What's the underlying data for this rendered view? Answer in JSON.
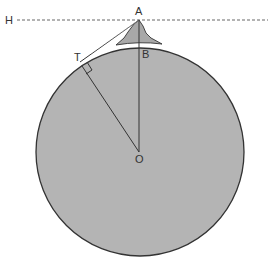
{
  "diagram": {
    "labels": {
      "H": "H",
      "A": "A",
      "B": "B",
      "T": "T",
      "O": "O"
    },
    "colors": {
      "earth_fill": "#b4b4b4",
      "mountain_fill": "#a8a8a8",
      "stroke": "#333333",
      "dashed_line": "#555555",
      "background": "#ffffff"
    },
    "points": {
      "A": [
        139,
        20
      ],
      "B": [
        139,
        48
      ],
      "T": [
        82,
        70
      ],
      "O": [
        139,
        152
      ],
      "H": [
        17,
        20
      ]
    },
    "circle": {
      "cx": 140,
      "cy": 152,
      "r": 104
    },
    "elements": [
      "Earth circle centered at O",
      "Mountain with peak A",
      "Dashed horizontal line H through A",
      "Tangent line from A to T",
      "Radius OT with right-angle marker at T",
      "Line AO through B"
    ]
  }
}
